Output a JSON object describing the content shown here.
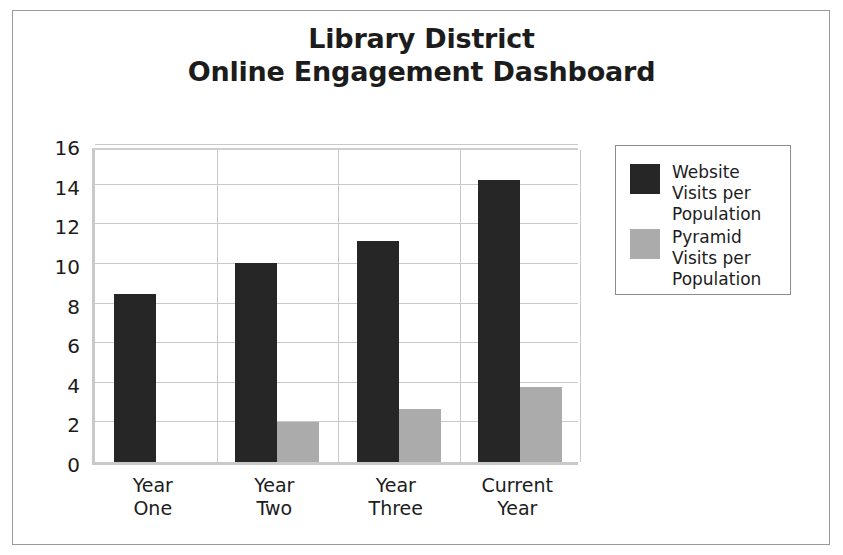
{
  "chart_data": {
    "type": "bar",
    "title": "Library District Online Engagement Dashboard",
    "title_line1": "Library District",
    "title_line2": "Online Engagement Dashboard",
    "xlabel": "",
    "ylabel": "",
    "ylim": [
      0,
      16
    ],
    "ytick_step": 2,
    "yticks": [
      "16",
      "14",
      "12",
      "10",
      "8",
      "6",
      "4",
      "2",
      "0"
    ],
    "ytick_values": [
      16,
      14,
      12,
      10,
      8,
      6,
      4,
      2,
      0
    ],
    "grid": true,
    "grid_axis": "both",
    "legend_position": "right",
    "categories": [
      "Year One",
      "Year Two",
      "Year Three",
      "Current Year"
    ],
    "category_lines": [
      [
        "Year",
        "One"
      ],
      [
        "Year",
        "Two"
      ],
      [
        "Year",
        "Three"
      ],
      [
        "Current",
        "Year"
      ]
    ],
    "series": [
      {
        "name": "Website Visits per Population",
        "name_line1": "Website Visits",
        "name_line2": "per Population",
        "color": "#262626",
        "values": [
          8.5,
          10.05,
          11.15,
          14.25
        ]
      },
      {
        "name": "Pyramid Visits per Population",
        "name_line1": "Pyramid Visits",
        "name_line2": "per Population",
        "color": "#ababab",
        "values": [
          0,
          2.0,
          2.7,
          3.8
        ]
      }
    ]
  },
  "colors": {
    "background": "#ffffff",
    "frame_border": "#9a9a9a",
    "grid": "#c9c9c9",
    "axis": "#c9c9c9",
    "text": "#1c1c1c",
    "series_dark": "#262626",
    "series_light": "#ababab",
    "legend_border": "#8c8c8c"
  }
}
